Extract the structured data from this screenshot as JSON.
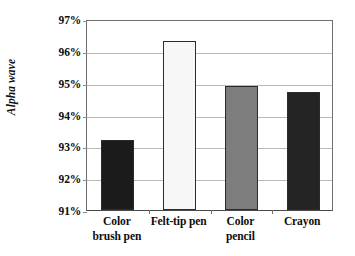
{
  "chart_data": {
    "type": "bar",
    "title": "",
    "xlabel": "",
    "ylabel": "Alpha wave",
    "categories": [
      "Color brush pen",
      "Felt-tip pen",
      "Color pencil",
      "Crayon"
    ],
    "category_lines": [
      [
        "Color",
        "brush pen"
      ],
      [
        "Felt-tip pen",
        ""
      ],
      [
        "Color",
        "pencil"
      ],
      [
        "Crayon",
        ""
      ]
    ],
    "values": [
      93.2,
      96.3,
      94.9,
      94.7
    ],
    "value_labels": [
      "93.2%",
      "96.3%",
      "94.9%",
      "94.7%"
    ],
    "ylim": [
      91,
      97
    ],
    "ytick_values": [
      97,
      96,
      95,
      94,
      93,
      92,
      91
    ],
    "ytick_labels": [
      "97%",
      "96%",
      "95%",
      "94%",
      "93%",
      "92%",
      "91%"
    ],
    "grid": true,
    "legend": "none",
    "bar_colors": [
      "#1b1b1b",
      "#f7f7f7",
      "#7d7d7d",
      "#242424"
    ],
    "bar_border_color": "#2b2b2b",
    "axis_color": "#6f6f6f",
    "gridline_color": "#b9b9b9",
    "background": "#ffffff"
  }
}
